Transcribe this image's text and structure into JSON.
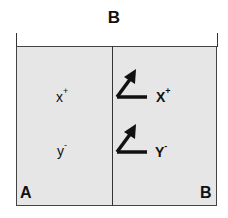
{
  "diagram": {
    "top_label": "B",
    "left_compartment": {
      "label": "A",
      "ions": [
        {
          "symbol": "x",
          "charge": "+"
        },
        {
          "symbol": "y",
          "charge": "-"
        }
      ]
    },
    "right_compartment": {
      "label": "B",
      "ions": [
        {
          "symbol": "X",
          "charge": "+",
          "marker": "diagonal-arrow-icon"
        },
        {
          "symbol": "Y",
          "charge": "-",
          "marker": "diagonal-arrow-icon"
        }
      ]
    },
    "colors": {
      "compartment_fill": "#e6e6e6",
      "line": "#333333",
      "text": "#111111"
    }
  }
}
